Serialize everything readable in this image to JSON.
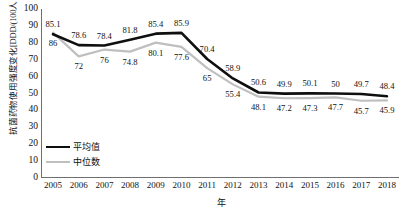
{
  "chart_data": {
    "type": "line",
    "title": "",
    "xlabel": "年",
    "ylabel": "抗菌药物使用强度变化[DDD/(100人·d)]",
    "categories": [
      "2005",
      "2006",
      "2007",
      "2008",
      "2009",
      "2010",
      "2011",
      "2012",
      "2013",
      "2014",
      "2015",
      "2016",
      "2017",
      "2018"
    ],
    "ylim": [
      0,
      100
    ],
    "yticks": [
      "0",
      "10",
      "20",
      "30",
      "40",
      "50",
      "60",
      "70",
      "80",
      "90",
      "100"
    ],
    "grid": false,
    "legend_position": "inside-bottom-left",
    "series": [
      {
        "name": "平均值",
        "color": "#0f0f0f",
        "label_position": "above",
        "values": [
          85.1,
          78.6,
          78.4,
          81.8,
          85.4,
          85.9,
          70.4,
          58.9,
          50.6,
          49.9,
          50.1,
          50,
          49.7,
          48.4
        ],
        "labels": [
          "85.1",
          "78.6",
          "78.4",
          "81.8",
          "85.4",
          "85.9",
          "70.4",
          "58.9",
          "50.6",
          "49.9",
          "50.1",
          "50",
          "49.7",
          "48.4"
        ]
      },
      {
        "name": "中位数",
        "color": "#bfbfbf",
        "label_position": "below",
        "values": [
          86,
          72,
          76,
          74.8,
          80.1,
          77.6,
          65,
          55.4,
          48.1,
          47.2,
          47.3,
          47.7,
          45.7,
          45.9
        ],
        "labels": [
          "86",
          "72",
          "76",
          "74.8",
          "80.1",
          "77.6",
          "65",
          "55.4",
          "48.1",
          "47.2",
          "47.3",
          "47.7",
          "45.7",
          "45.9"
        ]
      }
    ]
  },
  "legend": {
    "mean_label": "平均值",
    "median_label": "中位数"
  },
  "axis": {
    "x_title": "年",
    "y_title": "抗菌药物使用强度变化[DDD/(100人·d)]"
  }
}
